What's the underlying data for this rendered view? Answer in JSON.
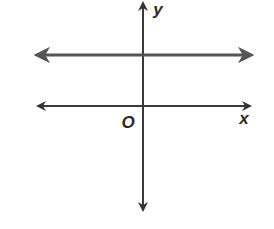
{
  "chart_data": {
    "type": "line",
    "title": "",
    "xlabel": "x",
    "ylabel": "y",
    "origin_label": "O",
    "grid": false,
    "xlim": [
      -2,
      2
    ],
    "ylim": [
      -2,
      2
    ],
    "series": [
      {
        "name": "horizontal line",
        "kind": "horizontal",
        "y": 1,
        "arrows": "both",
        "color": "#555555"
      }
    ],
    "axes": {
      "x_arrows": "both",
      "y_arrows": "both",
      "color": "#3a3a3a"
    },
    "note": "Horizontal line above the x-axis (y = positive constant); no tick marks shown"
  }
}
